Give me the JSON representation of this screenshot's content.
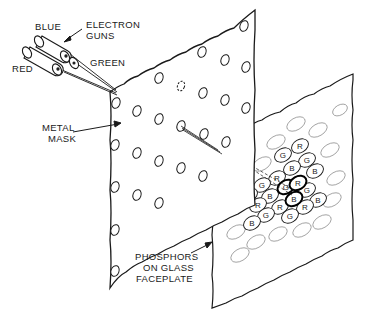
{
  "labels": {
    "blue": "BLUE",
    "electron_guns_line1": "ELECTRON",
    "electron_guns_line2": "GUNS",
    "red": "RED",
    "green": "GREEN",
    "metal_mask_line1": "METAL",
    "metal_mask_line2": "MASK",
    "phosphors_line1": "PHOSPHORS",
    "phosphors_line2": "ON GLASS",
    "phosphors_line3": "FACEPLATE"
  },
  "colors": {
    "ink": "#1a1a1a",
    "background": "#ffffff"
  },
  "phosphor_dots": [
    {
      "label": "R",
      "x": 300,
      "y": 146
    },
    {
      "label": "G",
      "x": 283,
      "y": 155
    },
    {
      "label": "G",
      "x": 307,
      "y": 160
    },
    {
      "label": "B",
      "x": 292,
      "y": 168
    },
    {
      "label": "B",
      "x": 315,
      "y": 171
    },
    {
      "label": "R",
      "x": 277,
      "y": 178
    },
    {
      "label": "G",
      "x": 286,
      "y": 187
    },
    {
      "label": "R",
      "x": 298,
      "y": 183
    },
    {
      "label": "G",
      "x": 262,
      "y": 185
    },
    {
      "label": "G",
      "x": 307,
      "y": 190
    },
    {
      "label": "B",
      "x": 249,
      "y": 195
    },
    {
      "label": "B",
      "x": 270,
      "y": 196
    },
    {
      "label": "B",
      "x": 294,
      "y": 199
    },
    {
      "label": "B",
      "x": 318,
      "y": 200
    },
    {
      "label": "R",
      "x": 258,
      "y": 205
    },
    {
      "label": "R",
      "x": 280,
      "y": 207
    },
    {
      "label": "R",
      "x": 305,
      "y": 207
    },
    {
      "label": "G",
      "x": 266,
      "y": 215
    },
    {
      "label": "G",
      "x": 290,
      "y": 216
    },
    {
      "label": "B",
      "x": 252,
      "y": 223
    }
  ]
}
